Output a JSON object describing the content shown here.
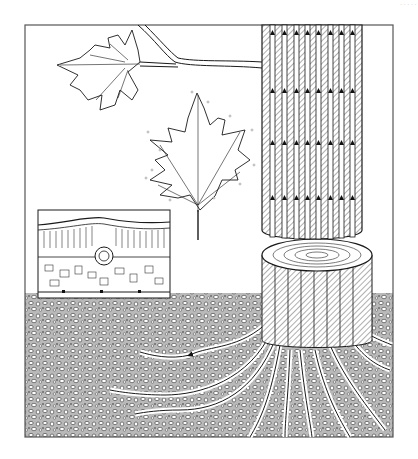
{
  "figure": {
    "title": "",
    "corner_text": "·····",
    "colors": {
      "ink": "#1a1a1a",
      "paper": "#ffffff",
      "soil_bg": "#bdbdbd",
      "xylem_hatch": "#8a8a8a",
      "frame": "#555555"
    }
  },
  "diagram": {
    "type": "illustration",
    "elements": [
      {
        "id": "frame",
        "label": "outer frame"
      },
      {
        "id": "branch",
        "label": "branch with compound lobed leaf"
      },
      {
        "id": "leaf",
        "label": "maple-type leaf with transpiration droplets"
      },
      {
        "id": "trunk",
        "label": "trunk section with xylem vessels, upward arrows"
      },
      {
        "id": "stump",
        "label": "cut stump with growth rings"
      },
      {
        "id": "roots",
        "label": "roots spreading into soil with inward arrows"
      },
      {
        "id": "soil",
        "label": "soil with particles"
      },
      {
        "id": "inset",
        "label": "leaf cross-section: epidermis, palisade, vein, spongy mesophyll, stomata"
      }
    ],
    "flow_direction": "roots → trunk → branch → leaves (upward)"
  }
}
